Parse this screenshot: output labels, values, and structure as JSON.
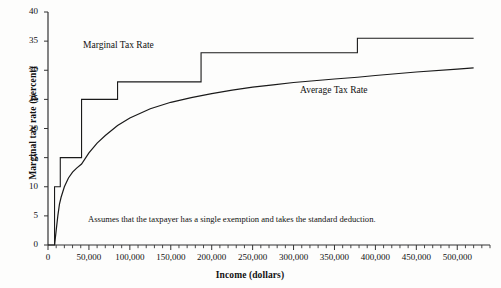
{
  "chart_data": {
    "type": "line",
    "title": "",
    "xlabel": "Income (dollars)",
    "ylabel": "Marginal tax rate (percent)",
    "xlim": [
      0,
      540000
    ],
    "ylim": [
      0,
      40
    ],
    "grid": false,
    "legend_position": "inline-annotations",
    "x_ticks_major": [
      0,
      50000,
      100000,
      150000,
      200000,
      250000,
      300000,
      350000,
      400000,
      450000,
      500000
    ],
    "x_tick_labels": [
      "0",
      "50,000",
      "100,000",
      "150,000",
      "200,000",
      "250,000",
      "300,000",
      "350,000",
      "400,000",
      "450,000",
      "500,000"
    ],
    "x_minor_tick_step": 10000,
    "y_ticks": [
      0,
      5,
      10,
      15,
      20,
      25,
      30,
      35,
      40
    ],
    "y_tick_labels": [
      "0",
      "5",
      "10",
      "15",
      "20",
      "25",
      "30",
      "35",
      "40"
    ],
    "annotations": [
      {
        "name": "marginal-series-label",
        "text": "Marginal Tax Rate"
      },
      {
        "name": "average-series-label",
        "text": "Average Tax Rate"
      },
      {
        "name": "assumption-note",
        "text": "Assumes that the taxpayer has a single exemption and takes the standard deduction."
      }
    ],
    "series": [
      {
        "name": "Marginal Tax Rate",
        "type": "step",
        "color": "#1a1a1a",
        "breakpoints": [
          0,
          8000,
          15000,
          41000,
          85000,
          187000,
          378000,
          520000
        ],
        "rates": [
          0,
          10,
          15,
          25,
          28,
          33,
          35.5
        ],
        "points": [
          [
            0,
            0
          ],
          [
            8000,
            0
          ],
          [
            8000,
            10
          ],
          [
            15000,
            10
          ],
          [
            15000,
            15
          ],
          [
            41000,
            15
          ],
          [
            41000,
            25
          ],
          [
            85000,
            25
          ],
          [
            85000,
            28
          ],
          [
            187000,
            28
          ],
          [
            187000,
            33
          ],
          [
            378000,
            33
          ],
          [
            378000,
            35.5
          ],
          [
            520000,
            35.5
          ]
        ]
      },
      {
        "name": "Average Tax Rate",
        "type": "line",
        "color": "#1a1a1a",
        "points": [
          [
            8000,
            0
          ],
          [
            10000,
            2.5
          ],
          [
            12000,
            5.0
          ],
          [
            14000,
            7.0
          ],
          [
            16000,
            8.2
          ],
          [
            20000,
            10.0
          ],
          [
            25000,
            11.5
          ],
          [
            30000,
            12.5
          ],
          [
            35000,
            13.2
          ],
          [
            41000,
            13.9
          ],
          [
            50000,
            15.8
          ],
          [
            60000,
            17.5
          ],
          [
            70000,
            18.8
          ],
          [
            85000,
            20.5
          ],
          [
            100000,
            21.8
          ],
          [
            125000,
            23.4
          ],
          [
            150000,
            24.5
          ],
          [
            175000,
            25.3
          ],
          [
            200000,
            26.0
          ],
          [
            225000,
            26.6
          ],
          [
            250000,
            27.1
          ],
          [
            275000,
            27.5
          ],
          [
            300000,
            27.9
          ],
          [
            325000,
            28.2
          ],
          [
            350000,
            28.5
          ],
          [
            378000,
            28.8
          ],
          [
            400000,
            29.1
          ],
          [
            450000,
            29.7
          ],
          [
            500000,
            30.2
          ],
          [
            520000,
            30.4
          ]
        ]
      }
    ]
  },
  "axes": {
    "x_title": "Income (dollars)",
    "y_title": "Marginal tax rate (percent)"
  }
}
